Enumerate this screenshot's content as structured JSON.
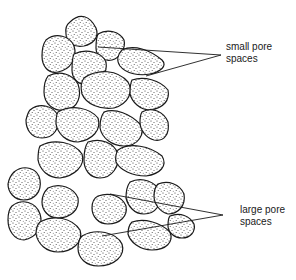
{
  "figure": {
    "labels": {
      "small_pores": {
        "line1": "small pore",
        "line2": "spaces"
      },
      "large_pores": {
        "line1": "large pore",
        "line2": "spaces"
      }
    },
    "colors": {
      "ink": "#1a1a1a",
      "background": "#ffffff"
    }
  }
}
